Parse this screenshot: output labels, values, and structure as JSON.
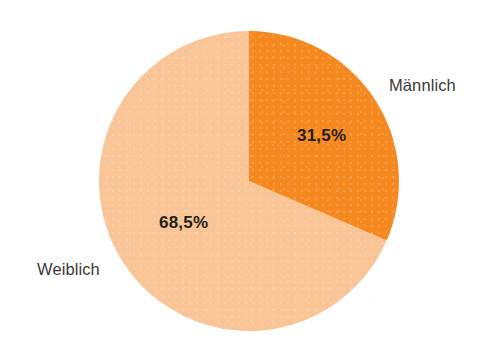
{
  "figure": {
    "background_color": "#ffffff",
    "width": 491,
    "height": 352
  },
  "chart_data": {
    "type": "pie",
    "title": "",
    "subtitle": "",
    "xlabel": "",
    "ylabel": "",
    "legend_position": "none",
    "grid": false,
    "labels_outside": true,
    "start_angle_deg": 0,
    "direction": "clockwise",
    "center": {
      "x": 249,
      "y": 181
    },
    "radius": 150,
    "categories": [
      "Männlich",
      "Weiblich"
    ],
    "values": [
      31.5,
      68.5
    ],
    "value_labels": [
      "31,5%",
      "68,5%"
    ],
    "colors": [
      "#f5881f",
      "#f9c496"
    ],
    "slices": [
      {
        "name": "Männlich",
        "value": 31.5,
        "value_label": "31,5%",
        "color": "#f5881f",
        "start_deg": 0,
        "end_deg": 113.4,
        "category_label": "Männlich",
        "value_label_color": "#231f20"
      },
      {
        "name": "Weiblich",
        "value": 68.5,
        "value_label": "68,5%",
        "color": "#f9c496",
        "start_deg": 113.4,
        "end_deg": 360,
        "category_label": "Weiblich",
        "value_label_color": "#231f20"
      }
    ],
    "units": "percent",
    "total": 100
  },
  "labels": {
    "maennlich": "Männlich",
    "weiblich": "Weiblich",
    "maennlich_value": "31,5%",
    "weiblich_value": "68,5%"
  },
  "colors": {
    "orange": "#f5881f",
    "peach": "#f9c496",
    "text": "#3b3a38",
    "value_text": "#231f20",
    "background": "#ffffff"
  }
}
